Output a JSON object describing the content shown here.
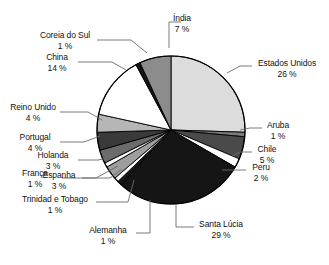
{
  "chart_data": {
    "type": "pie",
    "title": "",
    "title_cropped": true,
    "legend_position": "callout-labels",
    "value_suffix": "%",
    "categories": [
      "Estados Unidos",
      "Aruba",
      "Chile",
      "Peru",
      "Santa Lúcia",
      "Alemanha",
      "Trinidad e Tobago",
      "Espanha",
      "França",
      "Holanda",
      "Portugal",
      "Reino Unido",
      "China",
      "Coreia do Sul",
      "Índia"
    ],
    "values": [
      26,
      1,
      5,
      2,
      29,
      1,
      1,
      3,
      1,
      3,
      4,
      4,
      14,
      1,
      7
    ],
    "labels": [
      {
        "name": "Estados Unidos",
        "value": "26 %",
        "color": "#dcdcdc"
      },
      {
        "name": "Aruba",
        "value": "1 %",
        "color": "#7a7a7a"
      },
      {
        "name": "Chile",
        "value": "5 %",
        "color": "#4a4a4a"
      },
      {
        "name": "Peru",
        "value": "2 %",
        "color": "#ffffff"
      },
      {
        "name": "Santa Lúcia",
        "value": "29 %",
        "color": "#151515"
      },
      {
        "name": "Alemanha",
        "value": "1 %",
        "color": "#151515"
      },
      {
        "name": "Trinidad e Tobago",
        "value": "1 %",
        "color": "#ffffff"
      },
      {
        "name": "Espanha",
        "value": "3 %",
        "color": "#9e9e9e"
      },
      {
        "name": "França",
        "value": "1 %",
        "color": "#ffffff"
      },
      {
        "name": "Holanda",
        "value": "3 %",
        "color": "#6b6b6b"
      },
      {
        "name": "Portugal",
        "value": "4 %",
        "color": "#3a3a3a"
      },
      {
        "name": "Reino Unido",
        "value": "4 %",
        "color": "#b6b6b6"
      },
      {
        "name": "China",
        "value": "14 %",
        "color": "#ffffff"
      },
      {
        "name": "Coreia do Sul",
        "value": "1 %",
        "color": "#151515"
      },
      {
        "name": "Índia",
        "value": "7 %",
        "color": "#8c8c8c"
      }
    ],
    "colors": [
      "#dcdcdc",
      "#7a7a7a",
      "#4a4a4a",
      "#ffffff",
      "#151515",
      "#151515",
      "#ffffff",
      "#9e9e9e",
      "#ffffff",
      "#6b6b6b",
      "#3a3a3a",
      "#b6b6b6",
      "#ffffff",
      "#151515",
      "#8c8c8c"
    ],
    "stroke": "#000000",
    "background": "#ffffff"
  },
  "callouts": {
    "india": {
      "name": "Índia",
      "value": "7 %"
    },
    "coreia_do_sul": {
      "name": "Coreia do Sul",
      "value": "1 %"
    },
    "china": {
      "name": "China",
      "value": "14 %"
    },
    "reino_unido": {
      "name": "Reino Unido",
      "value": "4 %"
    },
    "portugal": {
      "name": "Portugal",
      "value": "4 %"
    },
    "holanda": {
      "name": "Holanda",
      "value": "3 %"
    },
    "franca": {
      "name": "França",
      "value": "1 %"
    },
    "espanha": {
      "name": "Espanha",
      "value": "3 %"
    },
    "trinidad": {
      "name": "Trinidad e Tobago",
      "value": "1 %"
    },
    "alemanha": {
      "name": "Alemanha",
      "value": "1 %"
    },
    "santa_lucia": {
      "name": "Santa Lúcia",
      "value": "29 %"
    },
    "peru": {
      "name": "Peru",
      "value": "2 %"
    },
    "chile": {
      "name": "Chile",
      "value": "5 %"
    },
    "aruba": {
      "name": "Aruba",
      "value": "1 %"
    },
    "estados_unidos": {
      "name": "Estados Unidos",
      "value": "26 %"
    }
  }
}
